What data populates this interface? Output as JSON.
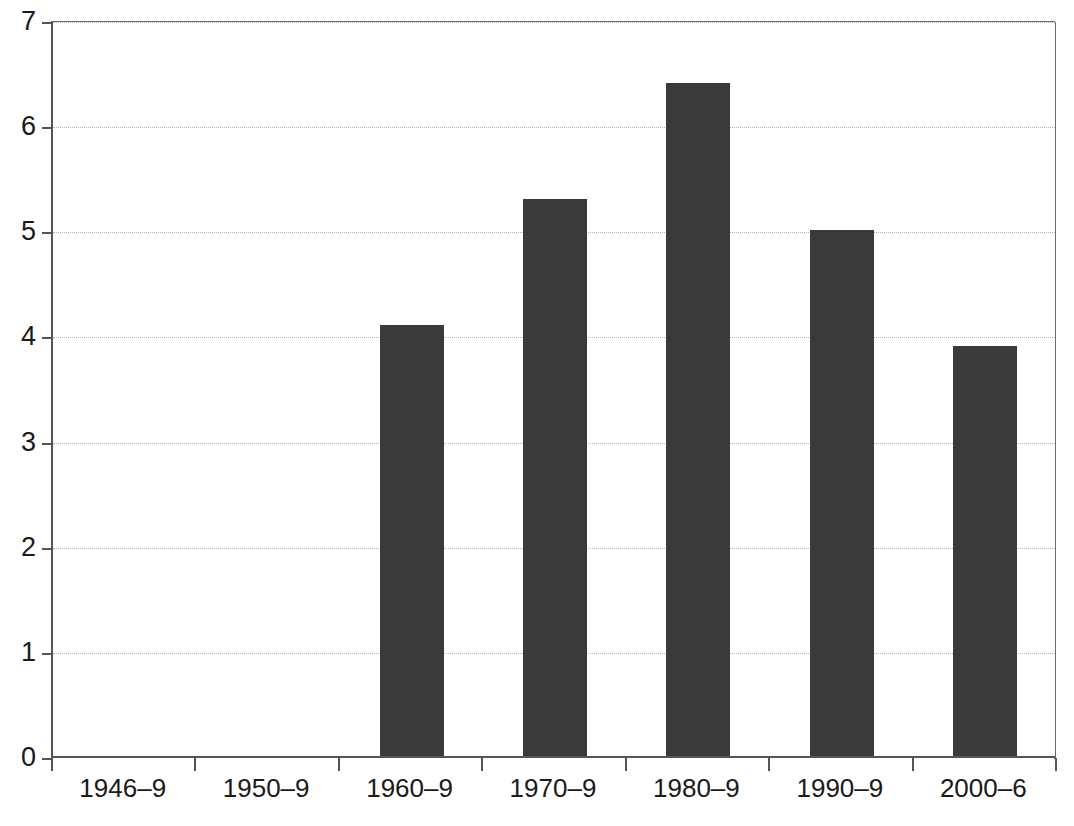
{
  "chart_data": {
    "type": "bar",
    "title": "",
    "subtitle": "",
    "xlabel": "",
    "ylabel": "",
    "categories": [
      "1946–9",
      "1950–9",
      "1960–9",
      "1970–9",
      "1980–9",
      "1990–9",
      "2000–6"
    ],
    "values": [
      0,
      0,
      4.1,
      5.3,
      6.4,
      5.0,
      3.9
    ],
    "ylim": [
      0,
      7
    ],
    "yticks": [
      0,
      1,
      2,
      3,
      4,
      5,
      6,
      7
    ],
    "ytick_labels": [
      "0",
      "1",
      "2",
      "3",
      "4",
      "5",
      "6",
      "7"
    ],
    "grid": "horizontal-dotted",
    "legend": "none",
    "bar_color": "#3a3a3a",
    "grid_color": "#b4b4b4",
    "axis_color": "#555555",
    "background_color": "#ffffff"
  }
}
